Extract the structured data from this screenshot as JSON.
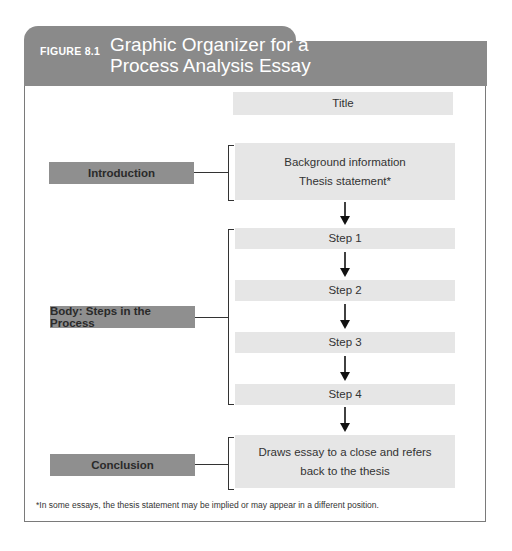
{
  "figure": {
    "label": "FIGURE 8.1",
    "title_line1": "Graphic Organizer for a",
    "title_line2": "Process Analysis Essay",
    "header_color": "#8a8a8a"
  },
  "diagram": {
    "title_box": "Title",
    "sections": [
      {
        "label": "Introduction",
        "content": [
          "Background information",
          "Thesis statement*"
        ]
      },
      {
        "label": "Body: Steps in the Process",
        "steps": [
          "Step 1",
          "Step 2",
          "Step 3",
          "Step 4"
        ]
      },
      {
        "label": "Conclusion",
        "content": [
          "Draws essay to a close and refers",
          "back to the thesis"
        ]
      }
    ]
  },
  "footnote": "*In some essays, the thesis statement may be implied or may appear in a different position."
}
